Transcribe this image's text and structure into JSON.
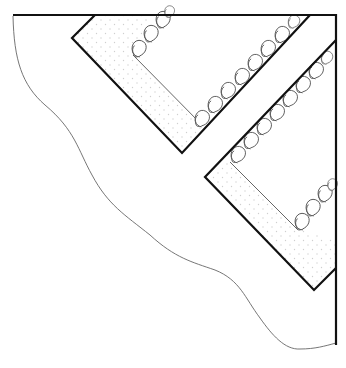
{
  "figure": {
    "type": "patent-style line drawing",
    "colors": {
      "background": "#ffffff",
      "outline": "#111111",
      "detail": "#555555",
      "stipple": "#cfcfcf"
    },
    "elements": [
      {
        "name": "outer-border",
        "kind": "thick line",
        "desc": "Top edge and right edge forming corner"
      },
      {
        "name": "wavy-edge",
        "kind": "thin curve",
        "desc": "Scalloped free edge from top-left to bottom-right"
      },
      {
        "name": "upper-band",
        "kind": "L-shaped stippled band with lace trim"
      },
      {
        "name": "lower-band",
        "kind": "L-shaped stippled band with lace trim"
      }
    ]
  }
}
